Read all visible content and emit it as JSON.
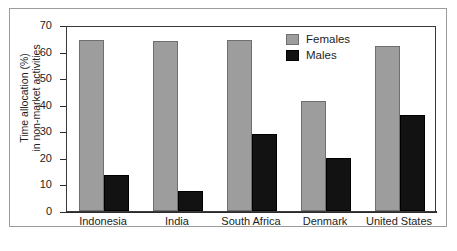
{
  "chart_data": {
    "type": "bar",
    "title": "",
    "subtitle": "",
    "xlabel": "",
    "ylabel": "Time allocation (%)\nin non-market activities",
    "categories": [
      "Indonesia",
      "India",
      "South Africa",
      "Denmark",
      "United States"
    ],
    "series": [
      {
        "name": "Females",
        "color": "#9d9d9d",
        "values": [
          64.5,
          64.0,
          64.5,
          41.5,
          62.0
        ]
      },
      {
        "name": "Males",
        "color": "#121212",
        "values": [
          13.5,
          7.5,
          29.0,
          20.0,
          36.0
        ]
      }
    ],
    "ylim": [
      0,
      70
    ],
    "ytick_labels": [
      "70",
      "60",
      "50",
      "40",
      "30",
      "20",
      "10",
      "0"
    ],
    "ytick_values": [
      70,
      60,
      50,
      40,
      30,
      20,
      10,
      0
    ],
    "grid": false,
    "legend_position": "top-right",
    "legend_entries": [
      "Females",
      "Males"
    ]
  },
  "figure": {
    "background_color": "#ffffff",
    "frame_color": "#9c9c9c",
    "axis_color": "#2b2b2b"
  }
}
